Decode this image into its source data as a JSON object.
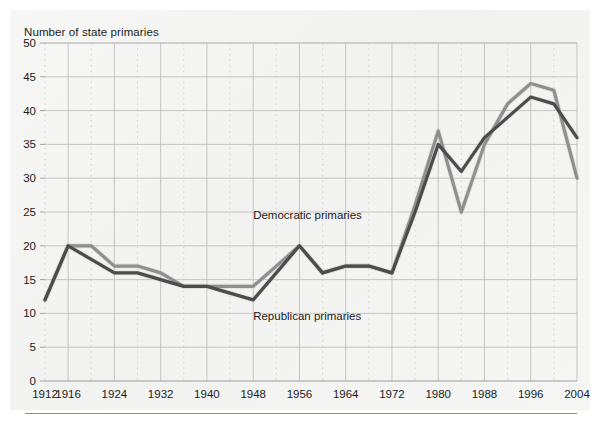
{
  "chart_data": {
    "type": "line",
    "title": "Number of state primaries",
    "ylabel": "Number of state primaries",
    "xlabel": "",
    "grid": true,
    "legend_position": "inline-annotations",
    "ylim": [
      0,
      50
    ],
    "xlim": [
      1912,
      2004
    ],
    "y_ticks": [
      0,
      5,
      10,
      15,
      20,
      25,
      30,
      35,
      40,
      45,
      50
    ],
    "x_ticks": [
      1912,
      1916,
      1924,
      1932,
      1940,
      1948,
      1956,
      1964,
      1972,
      1980,
      1988,
      1996,
      2004
    ],
    "x_tick_labels": [
      "1912",
      "1916",
      "1924",
      "1932",
      "1940",
      "1948",
      "1956",
      "1964",
      "1972",
      "1980",
      "1988",
      "1996",
      "2004"
    ],
    "y_tick_labels": [
      "0",
      "5",
      "10",
      "15",
      "20",
      "25",
      "30",
      "35",
      "40",
      "45",
      "50"
    ],
    "x": [
      1912,
      1916,
      1920,
      1924,
      1928,
      1932,
      1936,
      1940,
      1944,
      1948,
      1952,
      1956,
      1960,
      1964,
      1968,
      1972,
      1976,
      1980,
      1984,
      1988,
      1992,
      1996,
      2000,
      2004
    ],
    "series": [
      {
        "name": "Democratic primaries",
        "color": "#8f8f8f",
        "annotation": "Democratic primaries",
        "annotation_x": 1948,
        "annotation_y": 24,
        "values": [
          12,
          20,
          20,
          17,
          17,
          16,
          14,
          14,
          14,
          14,
          17,
          20,
          16,
          17,
          17,
          16,
          26,
          37,
          25,
          35,
          41,
          44,
          43,
          30
        ]
      },
      {
        "name": "Republican primaries",
        "color": "#4c4c4c",
        "annotation": "Republican primaries",
        "annotation_x": 1948,
        "annotation_y": 9,
        "values": [
          12,
          20,
          18,
          16,
          16,
          15,
          14,
          14,
          13,
          12,
          16,
          20,
          16,
          17,
          17,
          16,
          25,
          35,
          31,
          36,
          39,
          42,
          41,
          36
        ]
      }
    ],
    "annotations": [
      {
        "text": "Democratic primaries",
        "x": 1948,
        "y": 24
      },
      {
        "text": "Republican primaries",
        "x": 1948,
        "y": 9
      }
    ],
    "colors": {
      "democratic_line": "#8f8f8f",
      "republican_line": "#4c4c4c",
      "major_gridline": "#b9b9b9",
      "minor_gridline": "#c9c9c9",
      "axis": "#9a9a9a",
      "text": "#1b1b1b",
      "background": "#f4f4f3"
    }
  }
}
